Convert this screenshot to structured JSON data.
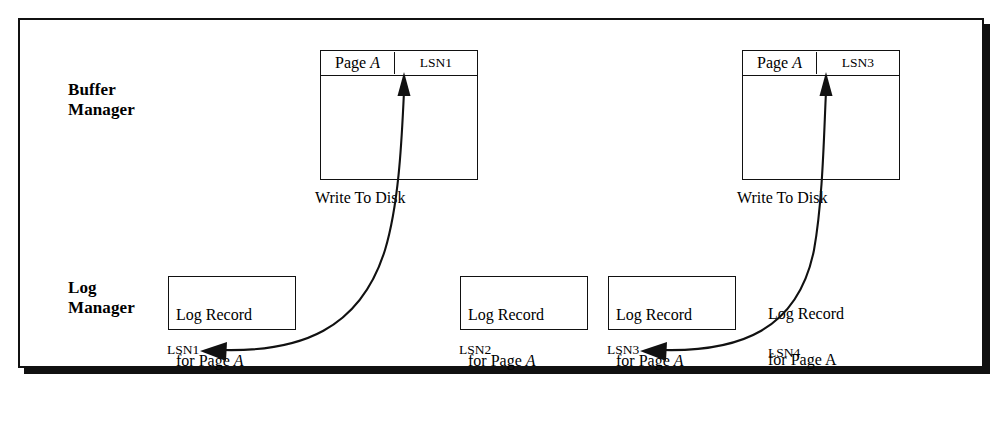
{
  "figure": {
    "domain": "diagram",
    "background_color": "#ffffff",
    "ink_color": "#111111"
  },
  "rows": {
    "buffer_manager_label": "Buffer\nManager",
    "log_manager_label": "Log\nManager"
  },
  "buffer_frames": [
    {
      "id": "buffer-frame-1",
      "page_label": "Page",
      "page_id": "A",
      "lsn_label": "LSN1"
    },
    {
      "id": "buffer-frame-2",
      "page_label": "Page",
      "page_id": "A",
      "lsn_label": "LSN3"
    }
  ],
  "write_captions": [
    {
      "id": "write-caption-1",
      "text": "Write To Disk"
    },
    {
      "id": "write-caption-2",
      "text": "Write To Disk"
    }
  ],
  "log_records": [
    {
      "id": "log-record-1",
      "line1": "Log Record",
      "line2_prefix": "for Page ",
      "line2_page": "A",
      "boxed": true,
      "lsn": "LSN1"
    },
    {
      "id": "log-record-2",
      "line1": "Log Record",
      "line2_prefix": "for Page ",
      "line2_page": "A",
      "boxed": true,
      "lsn": "LSN2"
    },
    {
      "id": "log-record-3",
      "line1": "Log Record",
      "line2_prefix": "for Page ",
      "line2_page": "A",
      "boxed": true,
      "lsn": "LSN3"
    },
    {
      "id": "log-record-4",
      "line1": "Log Record",
      "line2_prefix": "for Page ",
      "line2_page": "A",
      "boxed": false,
      "lsn": "LSN4"
    }
  ],
  "arrows": [
    {
      "id": "arrow-lsn1-to-buffer1",
      "description": "curved arrow from LSN1 log record area up to Page A / LSN1 buffer frame",
      "head": "up"
    },
    {
      "id": "arrow-buffer1-to-lsn1",
      "description": "curved arrow ending with leftward head next to LSN1",
      "head": "left"
    },
    {
      "id": "arrow-lsn3-to-buffer2",
      "description": "curved arrow from LSN3 log record area up to Page A / LSN3 buffer frame",
      "head": "up"
    },
    {
      "id": "arrow-buffer2-to-lsn3",
      "description": "curved arrow ending with leftward head next to LSN3",
      "head": "left"
    }
  ]
}
